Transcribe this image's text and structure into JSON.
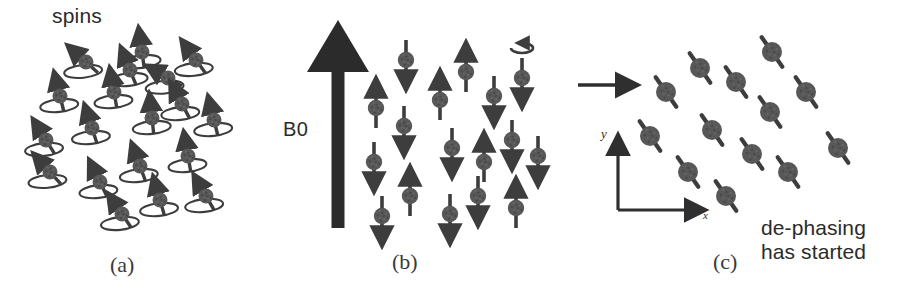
{
  "figure": {
    "title_label": "spins",
    "field_label": "B0",
    "dephasing_line1": "de-phasing",
    "dephasing_line2": "has started",
    "axis_y_label": "y",
    "axis_x_label": "x",
    "ink_color": "#3d3d3d",
    "ball_color": "#585858",
    "background": "#ffffff"
  },
  "panels": [
    {
      "id": "a",
      "caption": "(a)",
      "description": "randomly oriented precessing spins with precession cones",
      "spin_count": 19
    },
    {
      "id": "b",
      "caption": "(b)",
      "description": "spins aligned parallel and anti-parallel to the static field B0",
      "spin_count": 19
    },
    {
      "id": "c",
      "caption": "(c)",
      "description": "spins tipped into the transverse plane, de-phasing has started",
      "spin_count": 13
    }
  ],
  "diagram_data": {
    "type": "schematic",
    "panel_a_spins": [
      {
        "x": 86,
        "y": 62,
        "angle": 138,
        "ring": true
      },
      {
        "x": 142,
        "y": 52,
        "angle": 98,
        "ring": true
      },
      {
        "x": 60,
        "y": 96,
        "angle": 104,
        "ring": true
      },
      {
        "x": 114,
        "y": 92,
        "angle": 100,
        "ring": true
      },
      {
        "x": 130,
        "y": 70,
        "angle": 112,
        "ring": true
      },
      {
        "x": 168,
        "y": 78,
        "angle": 150,
        "ring": true
      },
      {
        "x": 196,
        "y": 60,
        "angle": 126,
        "ring": true
      },
      {
        "x": 46,
        "y": 140,
        "angle": 122,
        "ring": true
      },
      {
        "x": 92,
        "y": 128,
        "angle": 108,
        "ring": true
      },
      {
        "x": 152,
        "y": 118,
        "angle": 96,
        "ring": true
      },
      {
        "x": 182,
        "y": 104,
        "angle": 118,
        "ring": true
      },
      {
        "x": 214,
        "y": 120,
        "angle": 104,
        "ring": true
      },
      {
        "x": 50,
        "y": 172,
        "angle": 132,
        "ring": true
      },
      {
        "x": 100,
        "y": 182,
        "angle": 116,
        "ring": true
      },
      {
        "x": 140,
        "y": 166,
        "angle": 110,
        "ring": true
      },
      {
        "x": 188,
        "y": 156,
        "angle": 100,
        "ring": true
      },
      {
        "x": 122,
        "y": 214,
        "angle": 124,
        "ring": true
      },
      {
        "x": 160,
        "y": 200,
        "angle": 106,
        "ring": true
      },
      {
        "x": 206,
        "y": 196,
        "angle": 120,
        "ring": true
      }
    ],
    "panel_b_spins": [
      {
        "x": 406,
        "y": 60,
        "dir": "down",
        "precession": false
      },
      {
        "x": 376,
        "y": 108,
        "dir": "up",
        "precession": false
      },
      {
        "x": 440,
        "y": 100,
        "dir": "up",
        "precession": false
      },
      {
        "x": 466,
        "y": 72,
        "dir": "up",
        "precession": false
      },
      {
        "x": 494,
        "y": 96,
        "dir": "down",
        "precession": false
      },
      {
        "x": 522,
        "y": 78,
        "dir": "down",
        "precession": true
      },
      {
        "x": 404,
        "y": 126,
        "dir": "down",
        "precession": false
      },
      {
        "x": 374,
        "y": 162,
        "dir": "down",
        "precession": false
      },
      {
        "x": 452,
        "y": 148,
        "dir": "down",
        "precession": false
      },
      {
        "x": 484,
        "y": 162,
        "dir": "up",
        "precession": false
      },
      {
        "x": 512,
        "y": 140,
        "dir": "down",
        "precession": false
      },
      {
        "x": 538,
        "y": 156,
        "dir": "down",
        "precession": false
      },
      {
        "x": 410,
        "y": 196,
        "dir": "up",
        "precession": false
      },
      {
        "x": 382,
        "y": 216,
        "dir": "down",
        "precession": false
      },
      {
        "x": 450,
        "y": 214,
        "dir": "down",
        "precession": false
      },
      {
        "x": 478,
        "y": 196,
        "dir": "down",
        "precession": false
      },
      {
        "x": 516,
        "y": 208,
        "dir": "up",
        "precession": false
      }
    ],
    "panel_c_spins": [
      {
        "x": 772,
        "y": 52,
        "angle": 35
      },
      {
        "x": 700,
        "y": 68,
        "angle": 35
      },
      {
        "x": 736,
        "y": 82,
        "angle": 35
      },
      {
        "x": 666,
        "y": 92,
        "angle": 35
      },
      {
        "x": 806,
        "y": 92,
        "angle": 35
      },
      {
        "x": 770,
        "y": 112,
        "angle": 35
      },
      {
        "x": 650,
        "y": 136,
        "angle": 35
      },
      {
        "x": 712,
        "y": 130,
        "angle": 35
      },
      {
        "x": 752,
        "y": 154,
        "angle": 35
      },
      {
        "x": 838,
        "y": 148,
        "angle": 35
      },
      {
        "x": 688,
        "y": 172,
        "angle": 35
      },
      {
        "x": 788,
        "y": 172,
        "angle": 35
      },
      {
        "x": 726,
        "y": 196,
        "angle": 35
      }
    ],
    "b0_arrow": {
      "x": 338,
      "y_top": 20,
      "y_bottom": 228,
      "shaft_width": 13,
      "head_width": 62,
      "head_height": 52
    },
    "transition_arrow": {
      "x_start": 578,
      "x_end": 632,
      "y": 85
    },
    "axes": {
      "origin_x": 618,
      "origin_y": 210,
      "y_top": 140,
      "x_end": 700
    }
  }
}
